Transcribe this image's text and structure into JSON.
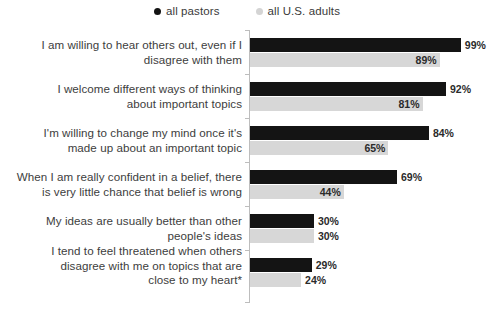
{
  "legend": {
    "items": [
      {
        "label": "all pastors",
        "color": "#141414",
        "marker": "dot"
      },
      {
        "label": "all U.S. adults",
        "color": "#d4d4d4",
        "marker": "dot"
      }
    ]
  },
  "chart_data": {
    "type": "bar",
    "orientation": "horizontal",
    "title": "",
    "subtitle": "",
    "xlabel": "",
    "ylabel": "",
    "xlim": [
      0,
      100
    ],
    "grid": false,
    "legend_position": "top-center",
    "value_suffix": "%",
    "categories": [
      "I am willing to hear others out, even if I disagree with them",
      "I welcome different ways of thinking about important topics",
      "I'm willing to change my mind once it's made up about an important topic",
      "When I am really confident in a belief, there is very little chance that belief is wrong",
      "My ideas are usually better than other people's ideas",
      "I tend to feel threatened when others disagree with me on topics that are close to my heart*"
    ],
    "category_lines": [
      [
        "I am willing to hear others out, even if I",
        "disagree with them"
      ],
      [
        "I welcome different ways of thinking",
        "about important topics"
      ],
      [
        "I'm willing to change my mind once it's",
        "made up about an important topic"
      ],
      [
        "When I am really confident in a belief, there",
        "is very little chance that belief is wrong"
      ],
      [
        "My ideas are usually better than other",
        "people's ideas"
      ],
      [
        "I tend to feel threatened when others",
        "disagree with me on topics that are",
        "close to my heart*"
      ]
    ],
    "series": [
      {
        "name": "all pastors",
        "color": "#141414",
        "values": [
          99,
          92,
          84,
          69,
          30,
          29
        ],
        "labels": [
          "99%",
          "92%",
          "84%",
          "69%",
          "30%",
          "29%"
        ],
        "label_placement": [
          "outside",
          "outside",
          "outside",
          "outside",
          "outside",
          "outside"
        ]
      },
      {
        "name": "all U.S. adults",
        "color": "#d7d7d7",
        "values": [
          89,
          81,
          65,
          44,
          30,
          24
        ],
        "labels": [
          "89%",
          "81%",
          "65%",
          "44%",
          "30%",
          "24%"
        ],
        "label_placement": [
          "inside",
          "inside",
          "inside",
          "inside",
          "outside",
          "outside"
        ]
      }
    ]
  },
  "layout": {
    "axis_x": 250,
    "px_per_percent": 2.13,
    "bar_height": 14,
    "group_top": [
      12,
      56,
      100,
      144,
      188,
      232
    ],
    "label_top": [
      14,
      58,
      102,
      146,
      190,
      226
    ],
    "tick_top": [
      4,
      48,
      92,
      136,
      180,
      224,
      272
    ]
  }
}
